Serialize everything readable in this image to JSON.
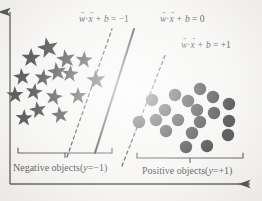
{
  "figure": {
    "type": "diagram",
    "background_color": "#f4f3f1",
    "ink_color": "#1a1a1a"
  },
  "axes": {
    "y_axis": {
      "name": "vertical-axis",
      "x": 10,
      "y_top": 8,
      "y_bottom": 184,
      "arrow": "up"
    },
    "x_axis": {
      "name": "horizontal-axis",
      "y": 184,
      "x_left": 10,
      "x_right": 255,
      "arrow": "right"
    }
  },
  "boundaries": [
    {
      "id": "margin-negative",
      "style": "dashed",
      "label": {
        "lhs_w": "w",
        "dot": "·",
        "lhs_x": "x",
        "plus_b": "+ b",
        "equals": "=",
        "rhs": "−1"
      },
      "label_text": "w⃗·x⃗ + b = −1",
      "x1": 67,
      "y1": 157,
      "x2": 112,
      "y2": 29
    },
    {
      "id": "decision-boundary",
      "style": "solid",
      "label": {
        "lhs_w": "w",
        "dot": "·",
        "lhs_x": "x",
        "plus_b": "+ b",
        "equals": "=",
        "rhs": "0"
      },
      "label_text": "w⃗·x⃗ + b = 0",
      "x1": 95,
      "y1": 153,
      "x2": 134,
      "y2": 29
    },
    {
      "id": "margin-positive",
      "style": "dashed",
      "label": {
        "lhs_w": "w",
        "dot": "·",
        "lhs_x": "x",
        "plus_b": "+ b",
        "equals": "=",
        "rhs": "+1"
      },
      "label_text": "w⃗·x⃗ + b = +1",
      "x1": 122,
      "y1": 166,
      "x2": 166,
      "y2": 53
    }
  ],
  "equation_labels": [
    {
      "id": "eq-neg-one",
      "rhs": "−1",
      "left": 79,
      "top": 15
    },
    {
      "id": "eq-zero",
      "rhs": "0",
      "left": 160,
      "top": 15
    },
    {
      "id": "eq-plus-one",
      "rhs": "+1",
      "left": 181,
      "top": 41
    }
  ],
  "classes": {
    "negative": {
      "marker": "star",
      "count": 15,
      "label": "Negative objects(",
      "label_var": "y",
      "label_tail": "=−1)",
      "label_full": "Negative objects(y=−1)",
      "label_left": 13,
      "label_top": 163,
      "brace": {
        "x_left": 18,
        "x_right": 112,
        "y": 153,
        "tick_x": 65
      },
      "points": [
        {
          "cx": 48,
          "cy": 48,
          "r": 11
        },
        {
          "cx": 31,
          "cy": 58,
          "r": 10
        },
        {
          "cx": 66,
          "cy": 59,
          "r": 10
        },
        {
          "cx": 84,
          "cy": 60,
          "r": 9
        },
        {
          "cx": 57,
          "cy": 72,
          "r": 10
        },
        {
          "cx": 70,
          "cy": 74,
          "r": 9
        },
        {
          "cx": 22,
          "cy": 77,
          "r": 9
        },
        {
          "cx": 43,
          "cy": 78,
          "r": 9
        },
        {
          "cx": 96,
          "cy": 80,
          "r": 10
        },
        {
          "cx": 34,
          "cy": 92,
          "r": 9
        },
        {
          "cx": 15,
          "cy": 95,
          "r": 9
        },
        {
          "cx": 54,
          "cy": 97,
          "r": 9
        },
        {
          "cx": 78,
          "cy": 96,
          "r": 9
        },
        {
          "cx": 38,
          "cy": 110,
          "r": 9
        },
        {
          "cx": 24,
          "cy": 118,
          "r": 9
        },
        {
          "cx": 60,
          "cy": 115,
          "r": 9
        }
      ]
    },
    "positive": {
      "marker": "dot",
      "count": 18,
      "label": "Positive objects(",
      "label_var": "y",
      "label_tail": "=+1)",
      "label_full": "Positive objects(y=+1)",
      "label_left": 142,
      "label_top": 166,
      "brace": {
        "x_left": 137,
        "x_right": 243,
        "y": 158,
        "tick_x": 190
      },
      "points": [
        {
          "cx": 200,
          "cy": 89,
          "r": 6.2
        },
        {
          "cx": 175,
          "cy": 95,
          "r": 6.2
        },
        {
          "cx": 213,
          "cy": 97,
          "r": 6.2
        },
        {
          "cx": 152,
          "cy": 100,
          "r": 6.2
        },
        {
          "cx": 188,
          "cy": 101,
          "r": 6.2
        },
        {
          "cx": 229,
          "cy": 104,
          "r": 6.2
        },
        {
          "cx": 165,
          "cy": 110,
          "r": 6.2
        },
        {
          "cx": 197,
          "cy": 110,
          "r": 6.2
        },
        {
          "cx": 214,
          "cy": 113,
          "r": 6.2
        },
        {
          "cx": 139,
          "cy": 122,
          "r": 6.2
        },
        {
          "cx": 156,
          "cy": 120,
          "r": 6.2
        },
        {
          "cx": 178,
          "cy": 120,
          "r": 6.2
        },
        {
          "cx": 200,
          "cy": 122,
          "r": 6.2
        },
        {
          "cx": 229,
          "cy": 121,
          "r": 6.2
        },
        {
          "cx": 166,
          "cy": 131,
          "r": 6.2
        },
        {
          "cx": 192,
          "cy": 133,
          "r": 6.2
        },
        {
          "cx": 228,
          "cy": 135,
          "r": 6.2
        },
        {
          "cx": 186,
          "cy": 147,
          "r": 6.2
        },
        {
          "cx": 207,
          "cy": 146,
          "r": 6.2
        }
      ]
    }
  }
}
